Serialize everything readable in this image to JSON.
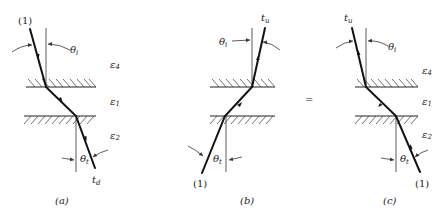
{
  "figure": {
    "equals_sign": "=",
    "panels": [
      {
        "id": "a",
        "caption": "(a)",
        "source_label": "(1)",
        "output_label": "t",
        "output_sub": "d",
        "theta_incident": "θ",
        "theta_incident_sub": "i",
        "theta_transmitted": "θ",
        "theta_transmitted_sub": "t",
        "direction": "downward"
      },
      {
        "id": "b",
        "caption": "(b)",
        "source_label": "(1)",
        "output_label": "t",
        "output_sub": "u",
        "theta_incident": "θ",
        "theta_incident_sub": "i",
        "theta_transmitted": "θ",
        "theta_transmitted_sub": "t",
        "direction": "upward"
      },
      {
        "id": "c",
        "caption": "(c)",
        "source_label": "(1)",
        "output_label": "t",
        "output_sub": "u",
        "theta_incident": "θ",
        "theta_incident_sub": "i",
        "theta_transmitted": "θ",
        "theta_transmitted_sub": "t",
        "direction": "upward"
      }
    ],
    "media": {
      "top": "ε",
      "top_sub": "4",
      "middle": "ε",
      "middle_sub": "1",
      "bottom": "ε",
      "bottom_sub": "2"
    }
  }
}
